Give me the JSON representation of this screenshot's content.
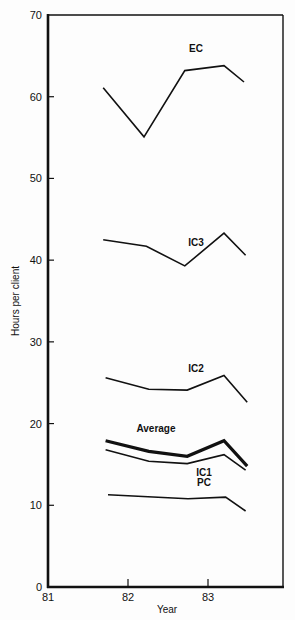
{
  "chart_data": {
    "type": "line",
    "title": "",
    "xlabel": "Year",
    "ylabel": "Hours per client",
    "xlim": [
      81,
      83.95
    ],
    "ylim": [
      0,
      70
    ],
    "x_ticks": [
      "81",
      "82",
      "83"
    ],
    "y_ticks": [
      "0",
      "10",
      "20",
      "30",
      "40",
      "50",
      "60",
      "70"
    ],
    "grid": false,
    "legend": "inline labels",
    "series": [
      {
        "name": "EC",
        "x": [
          81.69,
          82.2,
          82.71,
          83.2,
          83.45
        ],
        "values": [
          61.1,
          55.1,
          63.2,
          63.8,
          61.8
        ],
        "label_pos": [
          82.85,
          65.5
        ],
        "width": 1.6
      },
      {
        "name": "IC3",
        "x": [
          81.69,
          82.23,
          82.71,
          83.2,
          83.47
        ],
        "values": [
          42.5,
          41.7,
          39.3,
          43.3,
          40.6
        ],
        "label_pos": [
          82.85,
          41.7
        ],
        "width": 1.6
      },
      {
        "name": "IC2",
        "x": [
          81.72,
          82.26,
          82.74,
          83.2,
          83.49
        ],
        "values": [
          25.6,
          24.2,
          24.1,
          25.9,
          22.6
        ],
        "label_pos": [
          82.85,
          26.3
        ],
        "width": 1.6
      },
      {
        "name": "Average",
        "x": [
          81.72,
          82.26,
          82.74,
          83.2,
          83.49
        ],
        "values": [
          17.9,
          16.6,
          16.0,
          17.9,
          14.8
        ],
        "label_pos": [
          82.35,
          19.0
        ],
        "width": 3.2
      },
      {
        "name": "IC1",
        "x": [
          81.72,
          82.26,
          82.74,
          83.2,
          83.47
        ],
        "values": [
          16.8,
          15.4,
          15.1,
          16.2,
          14.3
        ],
        "label_pos": [
          82.95,
          13.6
        ],
        "width": 1.6
      },
      {
        "name": "PC",
        "x": [
          81.75,
          82.75,
          83.22,
          83.47
        ],
        "values": [
          11.3,
          10.8,
          11.0,
          9.3
        ],
        "label_pos": [
          82.95,
          12.3
        ],
        "width": 1.6
      }
    ]
  },
  "axes": {
    "x_title": "Year",
    "y_title": "Hours per client"
  }
}
